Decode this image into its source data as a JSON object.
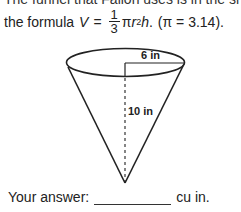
{
  "problem": {
    "cut_text": "The funnel that Fallon uses is in the shape of a cone",
    "formula_prefix": "the formula",
    "formula_var": "V",
    "equals": "=",
    "fraction_num": "1",
    "fraction_den": "3",
    "formula_rest_pi": "π",
    "formula_r": "r",
    "formula_exp": "2",
    "formula_h": "h",
    "formula_end": ".",
    "pi_note": "(π = 3.14)."
  },
  "diagram": {
    "radius_label": "6 in",
    "height_label": "10 in",
    "stroke_color": "#222222"
  },
  "answer": {
    "label": "Your answer:",
    "value": "",
    "unit": "cu in."
  }
}
